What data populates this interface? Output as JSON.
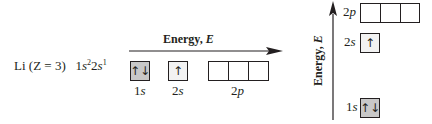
{
  "element": {
    "symbol": "Li",
    "atomic_number_label": "(Z = 3)",
    "configuration": {
      "parts": [
        {
          "n": "1",
          "l": "s",
          "electrons": "2"
        },
        {
          "n": "2",
          "l": "s",
          "electrons": "1"
        }
      ]
    }
  },
  "horizontal_diagram": {
    "axis_label": "Energy,",
    "axis_symbol": "E",
    "orbitals": [
      {
        "n": "1",
        "l": "s",
        "cells": 1,
        "arrows": [
          "↑↓"
        ],
        "fill": "#c8c8c8"
      },
      {
        "n": "2",
        "l": "s",
        "cells": 1,
        "arrows": [
          "↑"
        ],
        "fill": "#f2f2f2"
      },
      {
        "n": "2",
        "l": "p",
        "cells": 3,
        "arrows": [
          "",
          "",
          ""
        ],
        "fill": "#ffffff"
      }
    ]
  },
  "vertical_diagram": {
    "axis_label": "Energy,",
    "axis_symbol": "E",
    "levels": [
      {
        "n": "2",
        "l": "p",
        "cells": 3,
        "arrows": [
          "",
          "",
          ""
        ],
        "fill": "#ffffff"
      },
      {
        "n": "2",
        "l": "s",
        "cells": 1,
        "arrows": [
          "↑"
        ],
        "fill": "#f2f2f2"
      },
      {
        "n": "1",
        "l": "s",
        "cells": 1,
        "arrows": [
          "↑↓"
        ],
        "fill": "#c8c8c8"
      }
    ]
  },
  "colors": {
    "line": "#231f20",
    "filled_box": "#c8c8c8",
    "half_box": "#f2f2f2"
  }
}
